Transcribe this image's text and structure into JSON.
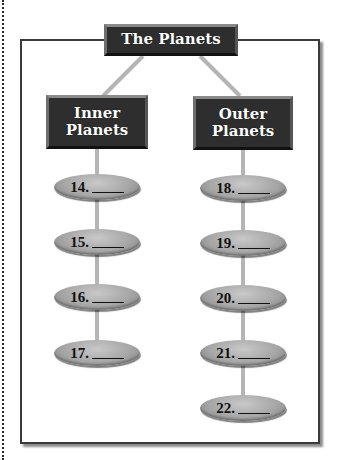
{
  "diagram": {
    "title": "The Planets",
    "branches": [
      {
        "label_lines": [
          "Inner",
          "Planets"
        ],
        "items": [
          {
            "number": "14.",
            "answer": ""
          },
          {
            "number": "15.",
            "answer": ""
          },
          {
            "number": "16.",
            "answer": ""
          },
          {
            "number": "17.",
            "answer": ""
          }
        ]
      },
      {
        "label_lines": [
          "Outer",
          "Planets"
        ],
        "items": [
          {
            "number": "18.",
            "answer": ""
          },
          {
            "number": "19.",
            "answer": ""
          },
          {
            "number": "20.",
            "answer": ""
          },
          {
            "number": "21.",
            "answer": ""
          },
          {
            "number": "22.",
            "answer": ""
          }
        ]
      }
    ]
  },
  "colors": {
    "box_fill": "#2e2e2e",
    "box_text": "#ffffff",
    "connector": "#b5b5b5",
    "oval_fill": "#a6a6a6",
    "frame_border": "#3a3a3a"
  }
}
